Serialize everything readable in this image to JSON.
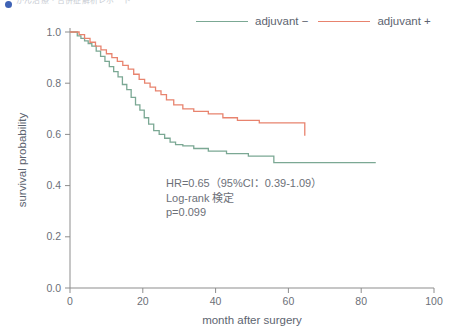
{
  "caption": {
    "bullet_icon": "bullet-icon",
    "text": "がん治療・合併症解析レポート"
  },
  "legend": {
    "position": "top-right",
    "entries": [
      {
        "label": "adjuvant −",
        "color": "#7ba894"
      },
      {
        "label": "adjuvant +",
        "color": "#e8836e"
      }
    ]
  },
  "annotation": {
    "line1": "HR=0.65（95%CI：0.39-1.09）",
    "line2": "Log-rank 検定",
    "line3": "p=0.099"
  },
  "chart_data": {
    "type": "line",
    "title": "",
    "subtitle": "",
    "xlabel": "month after surgery",
    "ylabel": "survival probability",
    "xlim": [
      0,
      100
    ],
    "ylim": [
      0.0,
      1.0
    ],
    "xticks": [
      0,
      20,
      40,
      60,
      80,
      100
    ],
    "yticks": [
      "0.0",
      "0.2",
      "0.4",
      "0.6",
      "0.8",
      "1.0"
    ],
    "ytick_values": [
      0.0,
      0.2,
      0.4,
      0.6,
      0.8,
      1.0
    ],
    "grid": false,
    "legend_position": "top-right",
    "step_type": "post",
    "statistics": {
      "hazard_ratio": 0.65,
      "ci_lower": 0.39,
      "ci_upper": 1.09,
      "ci_level": "95%",
      "test": "Log-rank",
      "p_value": 0.099
    },
    "series": [
      {
        "name": "adjuvant −",
        "color": "#7ba894",
        "x": [
          0,
          2.0,
          3.0,
          4.0,
          5.0,
          6.0,
          7.2,
          8.4,
          9.6,
          10.8,
          12.0,
          13.2,
          14.4,
          15.6,
          16.8,
          18.0,
          19.2,
          20.4,
          21.6,
          23.0,
          24.5,
          26.0,
          27.5,
          29.0,
          31.0,
          34.0,
          38.0,
          43.0,
          49.0,
          56.0,
          84.0
        ],
        "y": [
          1.0,
          0.985,
          0.975,
          0.965,
          0.955,
          0.945,
          0.925,
          0.905,
          0.885,
          0.865,
          0.845,
          0.825,
          0.795,
          0.775,
          0.745,
          0.715,
          0.695,
          0.665,
          0.64,
          0.615,
          0.6,
          0.585,
          0.57,
          0.56,
          0.555,
          0.545,
          0.535,
          0.525,
          0.515,
          0.49,
          0.49
        ]
      },
      {
        "name": "adjuvant +",
        "color": "#e8836e",
        "x": [
          0,
          2.5,
          4.0,
          5.5,
          7.0,
          8.5,
          10.0,
          11.5,
          13.0,
          14.5,
          16.0,
          17.5,
          19.0,
          20.5,
          22.0,
          23.5,
          25.0,
          26.5,
          28.5,
          31.0,
          34.0,
          38.0,
          42.0,
          46.0,
          52.0,
          63.5,
          64.5
        ],
        "y": [
          1.0,
          0.99,
          0.975,
          0.96,
          0.945,
          0.93,
          0.915,
          0.9,
          0.885,
          0.87,
          0.855,
          0.835,
          0.815,
          0.8,
          0.785,
          0.77,
          0.755,
          0.735,
          0.715,
          0.7,
          0.69,
          0.68,
          0.665,
          0.655,
          0.645,
          0.645,
          0.595
        ]
      }
    ]
  }
}
